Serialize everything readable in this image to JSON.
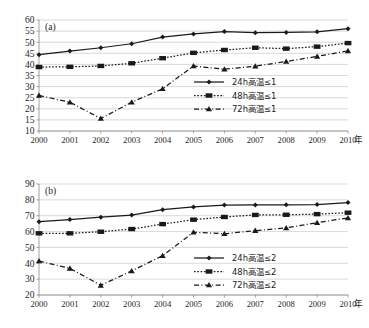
{
  "figure": {
    "axis_unit": "年",
    "panels": [
      {
        "tag": "(a)",
        "name": "panel-a"
      },
      {
        "tag": "(b)",
        "name": "panel-b"
      }
    ]
  },
  "chart_data": [
    {
      "type": "line",
      "title": "(a)",
      "xlabel": "年",
      "ylabel": "",
      "categories": [
        "2000",
        "2001",
        "2002",
        "2003",
        "2004",
        "2005",
        "2006",
        "2007",
        "2008",
        "2009",
        "2010"
      ],
      "x": [
        2000,
        2001,
        2002,
        2003,
        2004,
        2005,
        2006,
        2007,
        2008,
        2009,
        2010
      ],
      "ylim": [
        10,
        60
      ],
      "yticks": [
        10,
        15,
        20,
        25,
        30,
        35,
        40,
        45,
        50,
        55,
        60
      ],
      "grid": true,
      "legend_position": "inside-right-middle",
      "series": [
        {
          "name": "24h高温≤1",
          "marker": "diamond",
          "line_style": "solid",
          "values": [
            44.4,
            46.0,
            47.5,
            49.3,
            52.3,
            53.7,
            54.8,
            54.3,
            54.4,
            54.7,
            56.1
          ]
        },
        {
          "name": "48h高温≤1",
          "marker": "square",
          "line_style": "dotted",
          "values": [
            38.8,
            38.9,
            39.3,
            40.5,
            42.8,
            45.2,
            46.5,
            47.5,
            47.1,
            48.0,
            49.6
          ]
        },
        {
          "name": "72h高温≤1",
          "marker": "triangle",
          "line_style": "dash-dot",
          "values": [
            26.0,
            23.0,
            15.6,
            23.0,
            29.0,
            39.3,
            37.8,
            39.2,
            41.3,
            43.6,
            46.1
          ]
        }
      ]
    },
    {
      "type": "line",
      "title": "(b)",
      "xlabel": "年",
      "ylabel": "",
      "categories": [
        "2000",
        "2001",
        "2002",
        "2003",
        "2004",
        "2005",
        "2006",
        "2007",
        "2008",
        "2009",
        "2010"
      ],
      "x": [
        2000,
        2001,
        2002,
        2003,
        2004,
        2005,
        2006,
        2007,
        2008,
        2009,
        2010
      ],
      "ylim": [
        20,
        90
      ],
      "yticks": [
        20,
        30,
        40,
        50,
        60,
        70,
        80,
        90
      ],
      "grid": true,
      "legend_position": "inside-right-middle",
      "series": [
        {
          "name": "24h高温≤2",
          "marker": "diamond",
          "line_style": "solid",
          "values": [
            66.2,
            67.6,
            69.1,
            70.4,
            73.8,
            75.5,
            76.7,
            76.8,
            76.9,
            77.0,
            78.3
          ]
        },
        {
          "name": "48h高温≤2",
          "marker": "square",
          "line_style": "dotted",
          "values": [
            58.9,
            58.9,
            59.9,
            61.6,
            64.7,
            67.5,
            69.2,
            70.5,
            70.6,
            71.0,
            71.9
          ]
        },
        {
          "name": "72h高温≤2",
          "marker": "triangle",
          "line_style": "dash-dot",
          "values": [
            41.4,
            36.8,
            26.1,
            35.2,
            44.8,
            59.6,
            58.6,
            60.6,
            62.3,
            65.6,
            68.6
          ]
        }
      ]
    }
  ]
}
